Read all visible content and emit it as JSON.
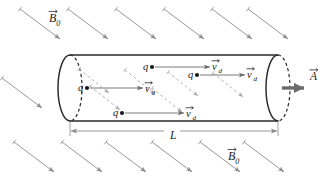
{
  "figure": {
    "background_color": "#ffffff",
    "width": 332,
    "height": 185
  },
  "colors": {
    "cylinder_outline": "#2b2b2b",
    "field_line": "#8c8c8c",
    "internal_field_line": "#a8a8a8",
    "drift_arrow": "#6b6b6b",
    "area_vector": "#6b6b6b",
    "dimension_line": "#8c8c8c",
    "text": "#1a1a1a"
  },
  "labels": {
    "b_field_top": {
      "symbol": "B",
      "subscript": "0",
      "vector": true,
      "x": 49,
      "y": 22
    },
    "b_field_bottom": {
      "symbol": "B",
      "subscript": "0",
      "vector": true,
      "x": 228,
      "y": 160
    },
    "area_vector": {
      "symbol": "A",
      "subscript": "",
      "vector": true,
      "x": 310,
      "y": 80
    },
    "length": {
      "symbol": "L",
      "subscript": "",
      "vector": false,
      "x": 170,
      "y": 139
    },
    "charge": {
      "symbol": "q",
      "subscript": "",
      "vector": false
    },
    "drift_velocity": {
      "symbol": "v",
      "subscript": "d",
      "vector": true
    }
  },
  "cylinder": {
    "left_x": 70,
    "right_x": 278,
    "top_y": 55,
    "bottom_y": 121,
    "cap_rx": 12,
    "cap_ry": 33
  },
  "charges": [
    {
      "id": "charge-1",
      "x": 87,
      "y": 88,
      "label_dx": -9,
      "arrow_len": 56,
      "vlabel_dx": 58,
      "vlabel_dy": 4
    },
    {
      "id": "charge-2",
      "x": 152,
      "y": 67,
      "label_dx": -9,
      "arrow_len": 58,
      "vlabel_dx": 60,
      "vlabel_dy": 3
    },
    {
      "id": "charge-3",
      "x": 197,
      "y": 75,
      "label_dx": -9,
      "arrow_len": 48,
      "vlabel_dx": 50,
      "vlabel_dy": 3
    },
    {
      "id": "charge-4",
      "x": 122,
      "y": 113,
      "label_dx": -9,
      "arrow_len": 62,
      "vlabel_dx": 64,
      "vlabel_dy": 4
    }
  ],
  "external_field_lines": {
    "direction": "down-right",
    "dx": 40,
    "dy": 30,
    "rows": [
      {
        "y": 9,
        "xs": [
          20,
          68,
          116,
          164,
          212,
          248
        ]
      },
      {
        "y": 78,
        "xs": [
          2
        ]
      },
      {
        "y": 142,
        "xs": [
          14,
          62,
          106,
          152,
          200,
          244
        ]
      }
    ]
  },
  "internal_field_lines": {
    "dx": 30,
    "dy": 24,
    "segments": [
      {
        "x": 79,
        "y": 69
      },
      {
        "x": 125,
        "y": 70
      },
      {
        "x": 168,
        "y": 72
      },
      {
        "x": 213,
        "y": 73
      },
      {
        "x": 90,
        "y": 86
      },
      {
        "x": 152,
        "y": 88
      }
    ]
  },
  "dimension": {
    "y": 131,
    "x_start": 70,
    "x_end": 278
  }
}
